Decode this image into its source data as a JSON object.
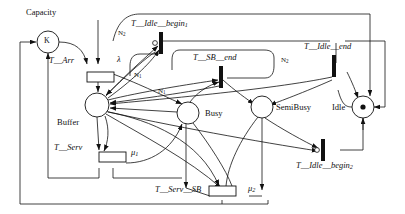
{
  "diagram": {
    "type": "petri-net",
    "background": "#ffffff",
    "stroke": "#111111",
    "width": 405,
    "height": 214
  },
  "places": [
    {
      "id": "capacity",
      "label": "Capacity",
      "label_style": "roman",
      "cx": 48,
      "cy": 42,
      "r": 11,
      "tokens_text": "K",
      "token_kind": "text",
      "label_x": 26,
      "label_y": 12
    },
    {
      "id": "buffer",
      "label": "Buffer",
      "label_style": "roman",
      "cx": 97,
      "cy": 105,
      "r": 12,
      "tokens_text": "",
      "token_kind": "none",
      "label_x": 62,
      "label_y": 120
    },
    {
      "id": "busy",
      "label": "Busy",
      "label_style": "roman",
      "cx": 188,
      "cy": 113,
      "r": 11,
      "tokens_text": "",
      "token_kind": "none",
      "label_x": 205,
      "label_y": 110
    },
    {
      "id": "semibusy",
      "label": "SemiBusy",
      "label_style": "roman",
      "cx": 262,
      "cy": 107,
      "r": 11,
      "tokens_text": "",
      "token_kind": "none",
      "label_x": 276,
      "label_y": 104
    },
    {
      "id": "idle",
      "label": "Idle",
      "label_style": "roman",
      "cx": 363,
      "cy": 107,
      "r": 11,
      "tokens_text": "•",
      "token_kind": "dot",
      "label_x": 334,
      "label_y": 104
    }
  ],
  "transitions": [
    {
      "id": "t_arr",
      "label": "T__Arr",
      "kind": "timed",
      "x": 87,
      "y": 72,
      "w": 27,
      "h": 10,
      "rate": "λ",
      "label_x": 49,
      "label_y": 60,
      "rate_x": 117,
      "rate_y": 59
    },
    {
      "id": "t_serv",
      "label": "T__Serv",
      "kind": "timed",
      "x": 99,
      "y": 158,
      "w": 27,
      "h": 10,
      "rate": "μ",
      "rate_sub": "1",
      "label_x": 54,
      "label_y": 145,
      "rate_x": 131,
      "rate_y": 149
    },
    {
      "id": "t_serv_sb",
      "label": "T__Serv__SB",
      "kind": "timed",
      "x": 222,
      "y": 190,
      "w": 27,
      "h": 10,
      "rate": "μ",
      "rate_sub": "2",
      "label_x": 155,
      "label_y": 187,
      "rate_x": 254,
      "rate_y": 185
    },
    {
      "id": "t_idle_begin_1",
      "label": "T__Idle__begin",
      "label_sub": "1",
      "kind": "immediate",
      "x": 161,
      "y": 43,
      "w": 4,
      "h": 22,
      "label_x": 131,
      "label_y": 21
    },
    {
      "id": "t_sb_end",
      "label": "T__SB__end",
      "kind": "immediate",
      "x": 221,
      "y": 76,
      "w": 4,
      "h": 22,
      "label_x": 196,
      "label_y": 55
    },
    {
      "id": "t_idle_end",
      "label": "T__Idle__end",
      "kind": "immediate",
      "x": 334,
      "y": 65,
      "w": 4,
      "h": 22,
      "label_x": 306,
      "label_y": 44
    },
    {
      "id": "t_idle_begin_2",
      "label": "T__Idle__begin",
      "label_sub": "2",
      "kind": "immediate",
      "x": 323,
      "y": 150,
      "w": 4,
      "h": 22,
      "label_x": 298,
      "label_y": 163
    }
  ],
  "arc_weights": [
    {
      "id": "w1",
      "text": "N",
      "sub": "2",
      "x": 120,
      "y": 32
    },
    {
      "id": "w2",
      "text": "N",
      "sub": "1",
      "x": 136,
      "y": 74
    },
    {
      "id": "w3",
      "text": "N",
      "sub": "1",
      "x": 160,
      "y": 90
    },
    {
      "id": "w4",
      "text": "N",
      "sub": "2",
      "x": 283,
      "y": 59
    }
  ]
}
